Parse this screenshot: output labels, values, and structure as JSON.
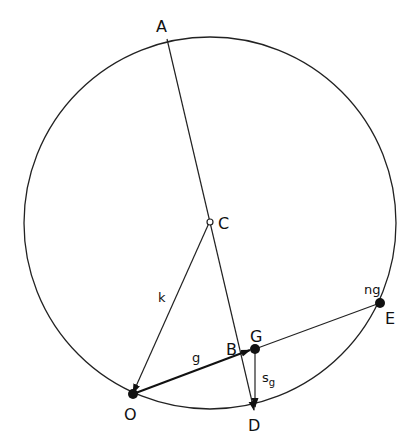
{
  "diagram": {
    "points": {
      "A": {
        "label": "A"
      },
      "B": {
        "label": "B"
      },
      "C": {
        "label": "C"
      },
      "D": {
        "label": "D"
      },
      "E": {
        "label": "E"
      },
      "G": {
        "label": "G"
      },
      "O": {
        "label": "O"
      }
    },
    "vector_labels": {
      "k": "k",
      "g": "g",
      "sg_main": "s",
      "sg_sub": "g",
      "ng": "ng"
    }
  }
}
